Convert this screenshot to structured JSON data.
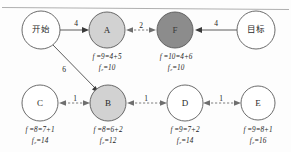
{
  "diagram": {
    "title_rule": true,
    "colors": {
      "node_fill_default": "#ffffff",
      "node_fill_light": "#d2d2d2",
      "node_fill_dark": "#8c8c8c",
      "node_stroke": "#5a5a5a",
      "edge_solid": "#4a4a4a",
      "edge_dashed": "#707070",
      "text": "#1c1c1c"
    },
    "nodes": [
      {
        "id": "start",
        "label": "开始",
        "cx": 41,
        "cy": 30,
        "r": 19,
        "shade": "none",
        "cost_line1": "",
        "cost_line2": ""
      },
      {
        "id": "A",
        "label": "A",
        "cx": 107,
        "cy": 30,
        "r": 18,
        "shade": "light",
        "cost_line1": "f =9=4+5",
        "cost_line2": "f₂=10"
      },
      {
        "id": "F",
        "label": "F",
        "cx": 175,
        "cy": 30,
        "r": 18,
        "shade": "dark",
        "cost_line1": "f =10=4+6",
        "cost_line2": "f₂=10"
      },
      {
        "id": "goal",
        "label": "目标",
        "cx": 256,
        "cy": 30,
        "r": 19,
        "shade": "none",
        "cost_line1": "",
        "cost_line2": ""
      },
      {
        "id": "C",
        "label": "C",
        "cx": 40,
        "cy": 103,
        "r": 18,
        "shade": "none",
        "cost_line1": "f =8=7+1",
        "cost_line2": "f₂=14"
      },
      {
        "id": "B",
        "label": "B",
        "cx": 108,
        "cy": 103,
        "r": 18,
        "shade": "light",
        "cost_line1": "f =8=6+2",
        "cost_line2": "f₂=12"
      },
      {
        "id": "D",
        "label": "D",
        "cx": 185,
        "cy": 103,
        "r": 18,
        "shade": "none",
        "cost_line1": "f =9=7+2",
        "cost_line2": "f₂=14"
      },
      {
        "id": "E",
        "label": "E",
        "cx": 258,
        "cy": 103,
        "r": 17,
        "shade": "none",
        "cost_line1": "f =9=8+1",
        "cost_line2": "f₂=16"
      }
    ],
    "edges": [
      {
        "id": "start-A",
        "from": "start",
        "to": "A",
        "weight": "4",
        "style": "solid",
        "direction": "forward",
        "label_x": 76,
        "label_y": 24
      },
      {
        "id": "start-B",
        "from": "start",
        "to": "B",
        "weight": "6",
        "style": "solid",
        "direction": "forward",
        "label_x": 64,
        "label_y": 70
      },
      {
        "id": "A-F",
        "from": "A",
        "to": "F",
        "weight": "2",
        "style": "dashed",
        "direction": "both",
        "label_x": 141,
        "label_y": 27
      },
      {
        "id": "goal-F",
        "from": "goal",
        "to": "F",
        "weight": "4",
        "style": "solid",
        "direction": "forward",
        "label_x": 216,
        "label_y": 24
      },
      {
        "id": "B-C",
        "from": "B",
        "to": "C",
        "weight": "1",
        "style": "dashed",
        "direction": "both",
        "label_x": 74,
        "label_y": 100
      },
      {
        "id": "B-D",
        "from": "B",
        "to": "D",
        "weight": "1",
        "style": "dashed",
        "direction": "both",
        "label_x": 146,
        "label_y": 100
      },
      {
        "id": "D-E",
        "from": "D",
        "to": "E",
        "weight": "1",
        "style": "dashed",
        "direction": "both",
        "label_x": 221,
        "label_y": 100
      }
    ]
  }
}
